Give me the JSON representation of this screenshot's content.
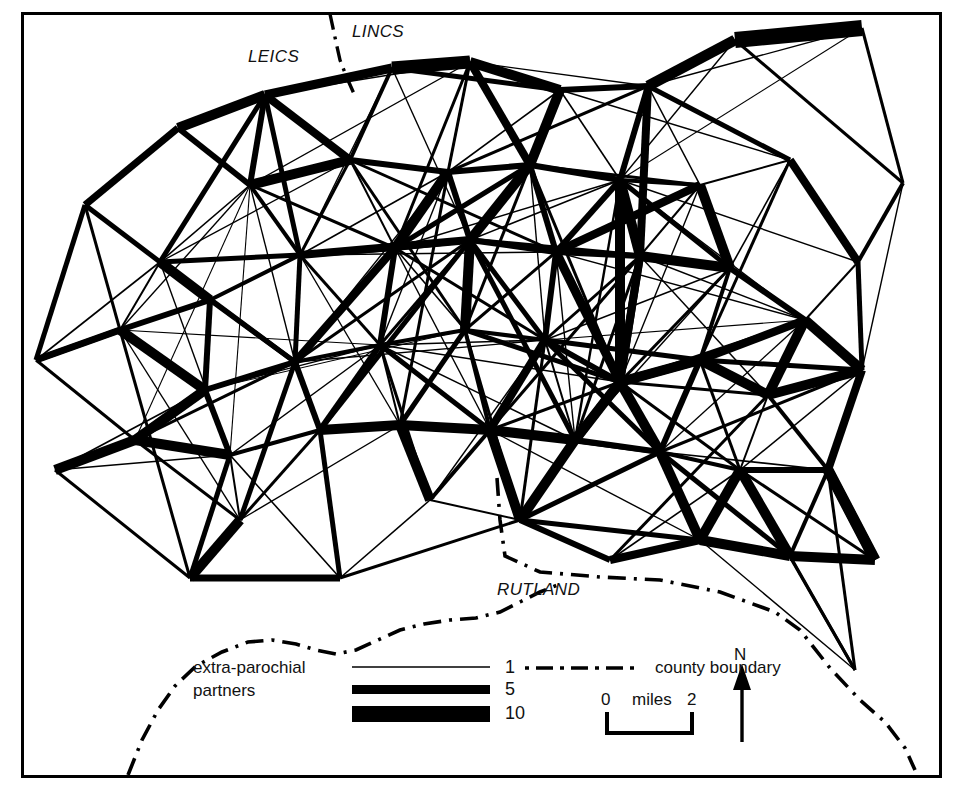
{
  "map": {
    "title": "Parish extra-parochial partner network map",
    "frame_color": "#000000",
    "background": "#ffffff",
    "line_color": "#000000"
  },
  "county_labels": [
    {
      "name": "leics-label",
      "text": "LEICS",
      "x": 248,
      "y": 55
    },
    {
      "name": "lincs-label",
      "text": "LINCS",
      "x": 352,
      "y": 30
    },
    {
      "name": "rutland-label",
      "text": "RUTLAND",
      "x": 497,
      "y": 588
    }
  ],
  "legend": {
    "partners_label_line1": "extra-parochial",
    "partners_label_line2": "partners",
    "weights": [
      {
        "value": "1",
        "stroke": 1.2
      },
      {
        "value": "5",
        "stroke": 7
      },
      {
        "value": "10",
        "stroke": 14
      }
    ],
    "county_boundary_label": "county boundary"
  },
  "scale_bar": {
    "left_label": "0",
    "unit_label": "miles",
    "right_label": "2"
  },
  "north_arrow": {
    "label": "N"
  },
  "chart_data": {
    "type": "network-map",
    "edge_weight_legend": [
      1,
      5,
      10
    ],
    "units": "miles",
    "scale_bar_miles": 2,
    "nodes": [
      {
        "id": "n0",
        "x": 36,
        "y": 360
      },
      {
        "id": "n1",
        "x": 85,
        "y": 205
      },
      {
        "id": "n2",
        "x": 178,
        "y": 128
      },
      {
        "id": "n3",
        "x": 265,
        "y": 95
      },
      {
        "id": "n4",
        "x": 392,
        "y": 68
      },
      {
        "id": "n5",
        "x": 470,
        "y": 62
      },
      {
        "id": "n6",
        "x": 560,
        "y": 90
      },
      {
        "id": "n7",
        "x": 648,
        "y": 86
      },
      {
        "id": "n8",
        "x": 735,
        "y": 40
      },
      {
        "id": "n9",
        "x": 862,
        "y": 28
      },
      {
        "id": "n10",
        "x": 903,
        "y": 183
      },
      {
        "id": "n11",
        "x": 858,
        "y": 262
      },
      {
        "id": "n12",
        "x": 790,
        "y": 160
      },
      {
        "id": "n13",
        "x": 700,
        "y": 185
      },
      {
        "id": "n14",
        "x": 620,
        "y": 180
      },
      {
        "id": "n15",
        "x": 530,
        "y": 165
      },
      {
        "id": "n16",
        "x": 448,
        "y": 172
      },
      {
        "id": "n17",
        "x": 350,
        "y": 160
      },
      {
        "id": "n18",
        "x": 250,
        "y": 185
      },
      {
        "id": "n19",
        "x": 160,
        "y": 262
      },
      {
        "id": "n20",
        "x": 120,
        "y": 330
      },
      {
        "id": "n21",
        "x": 210,
        "y": 300
      },
      {
        "id": "n22",
        "x": 300,
        "y": 255
      },
      {
        "id": "n23",
        "x": 395,
        "y": 248
      },
      {
        "id": "n24",
        "x": 470,
        "y": 240
      },
      {
        "id": "n25",
        "x": 556,
        "y": 252
      },
      {
        "id": "n26",
        "x": 640,
        "y": 256
      },
      {
        "id": "n27",
        "x": 730,
        "y": 268
      },
      {
        "id": "n28",
        "x": 805,
        "y": 320
      },
      {
        "id": "n29",
        "x": 862,
        "y": 370
      },
      {
        "id": "n30",
        "x": 768,
        "y": 395
      },
      {
        "id": "n31",
        "x": 700,
        "y": 360
      },
      {
        "id": "n32",
        "x": 620,
        "y": 382
      },
      {
        "id": "n33",
        "x": 545,
        "y": 340
      },
      {
        "id": "n34",
        "x": 465,
        "y": 330
      },
      {
        "id": "n35",
        "x": 380,
        "y": 345
      },
      {
        "id": "n36",
        "x": 295,
        "y": 362
      },
      {
        "id": "n37",
        "x": 205,
        "y": 390
      },
      {
        "id": "n38",
        "x": 135,
        "y": 440
      },
      {
        "id": "n39",
        "x": 230,
        "y": 455
      },
      {
        "id": "n40",
        "x": 320,
        "y": 430
      },
      {
        "id": "n41",
        "x": 400,
        "y": 425
      },
      {
        "id": "n42",
        "x": 490,
        "y": 430
      },
      {
        "id": "n43",
        "x": 575,
        "y": 440
      },
      {
        "id": "n44",
        "x": 660,
        "y": 452
      },
      {
        "id": "n45",
        "x": 740,
        "y": 470
      },
      {
        "id": "n46",
        "x": 828,
        "y": 470
      },
      {
        "id": "n47",
        "x": 875,
        "y": 560
      },
      {
        "id": "n48",
        "x": 790,
        "y": 556
      },
      {
        "id": "n49",
        "x": 700,
        "y": 540
      },
      {
        "id": "n50",
        "x": 610,
        "y": 560
      },
      {
        "id": "n51",
        "x": 520,
        "y": 520
      },
      {
        "id": "n52",
        "x": 430,
        "y": 500
      },
      {
        "id": "n53",
        "x": 340,
        "y": 578
      },
      {
        "id": "n54",
        "x": 190,
        "y": 578
      },
      {
        "id": "n55",
        "x": 855,
        "y": 670
      },
      {
        "id": "n56",
        "x": 240,
        "y": 520
      },
      {
        "id": "n57",
        "x": 55,
        "y": 470
      }
    ],
    "edge_weight_range": [
      1,
      10
    ]
  }
}
